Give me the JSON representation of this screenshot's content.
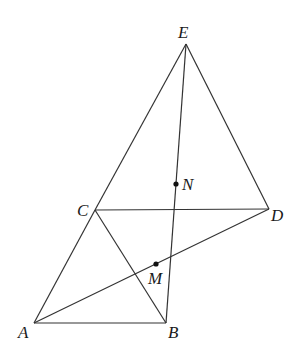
{
  "diagram": {
    "type": "geometry",
    "points": {
      "E": {
        "label": "E",
        "x": 186,
        "y": 44,
        "lx": 178,
        "ly": 38
      },
      "C": {
        "label": "C",
        "x": 95,
        "y": 210,
        "lx": 77,
        "ly": 216
      },
      "D": {
        "label": "D",
        "x": 269,
        "y": 209,
        "lx": 271,
        "ly": 221
      },
      "A": {
        "label": "A",
        "x": 34,
        "y": 323,
        "lx": 18,
        "ly": 338
      },
      "B": {
        "label": "B",
        "x": 166,
        "y": 323,
        "lx": 168,
        "ly": 338
      },
      "N": {
        "label": "N",
        "x": 176,
        "y": 184,
        "lx": 182,
        "ly": 190
      },
      "M": {
        "label": "M",
        "x": 156,
        "y": 264,
        "lx": 148,
        "ly": 284
      }
    },
    "segments": [
      [
        "E",
        "C"
      ],
      [
        "E",
        "D"
      ],
      [
        "E",
        "B"
      ],
      [
        "C",
        "D"
      ],
      [
        "C",
        "A"
      ],
      [
        "C",
        "B"
      ],
      [
        "A",
        "B"
      ],
      [
        "A",
        "D"
      ]
    ],
    "marked_points": [
      "N",
      "M"
    ],
    "colors": {
      "stroke": "#333333",
      "text": "#1a1a1a",
      "background": "#ffffff"
    }
  }
}
